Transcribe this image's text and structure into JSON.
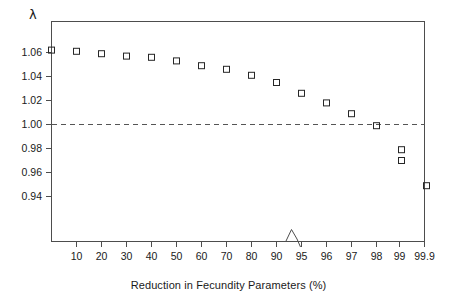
{
  "chart_data": {
    "type": "scatter",
    "title": "",
    "xlabel": "Reduction in Fecundity Parameters (%)",
    "ylabel": "λ",
    "categories": [
      "0",
      "10",
      "20",
      "30",
      "40",
      "50",
      "60",
      "70",
      "80",
      "90",
      "95",
      "96",
      "97",
      "98",
      "99",
      "99.9"
    ],
    "x_tick_labels": [
      "10",
      "20",
      "30",
      "40",
      "50",
      "60",
      "70",
      "80",
      "90",
      "95",
      "96",
      "97",
      "98",
      "99",
      "99.9"
    ],
    "x": [
      0,
      10,
      20,
      30,
      40,
      50,
      60,
      70,
      80,
      90,
      95,
      96,
      97,
      98,
      99,
      99.9
    ],
    "values": [
      1.062,
      1.061,
      1.059,
      1.057,
      1.056,
      1.053,
      1.049,
      1.046,
      1.041,
      1.035,
      1.026,
      1.018,
      1.009,
      0.999,
      0.979,
      0.949
    ],
    "extra_points": [
      {
        "x": 99,
        "y": 0.97,
        "note": "second marker stacked at 99"
      }
    ],
    "y_tick_labels": [
      "0.94",
      "0.96",
      "0.98",
      "1.00",
      "1.02",
      "1.04",
      "1.06"
    ],
    "y_ticks": [
      0.94,
      0.96,
      0.98,
      1.0,
      1.02,
      1.04,
      1.06
    ],
    "ylim": [
      0.925,
      1.072
    ],
    "reference_line": {
      "y": 1.0,
      "style": "dashed",
      "label": "1.00"
    },
    "axis_break": {
      "between": [
        "90",
        "95"
      ],
      "symbol": "zigzag"
    },
    "grid": false,
    "legend": null,
    "marker_style": "open-square",
    "colors": {
      "marker_stroke": "#262626",
      "axis": "#4d4d4d",
      "reference_line": "#555555",
      "background": "#ffffff",
      "text": "#1a1a1a"
    }
  }
}
